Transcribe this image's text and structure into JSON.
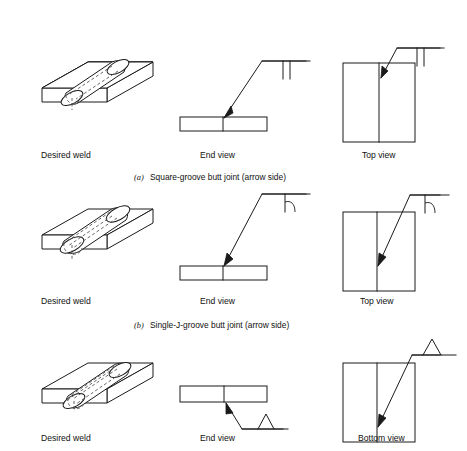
{
  "figure": {
    "background_color": "#ffffff",
    "line_color": "#1a1a1a",
    "hidden_line_color": "#555555",
    "width": 467,
    "height": 451
  },
  "rows": [
    {
      "id": "row-a",
      "caption_marker": "(a)",
      "caption_text": "Square-groove butt joint (arrow side)",
      "weld_symbol": "square-groove",
      "symbol_side": "arrow-side-below-reference-line",
      "views": [
        {
          "id": "view-a-iso",
          "label": "Desired weld"
        },
        {
          "id": "view-a-end",
          "label": "End view"
        },
        {
          "id": "view-a-top",
          "label": "Top view"
        }
      ]
    },
    {
      "id": "row-b",
      "caption_marker": "(b)",
      "caption_text": "Single-J-groove butt joint (arrow side)",
      "weld_symbol": "single-J-groove",
      "symbol_side": "arrow-side-below-reference-line",
      "views": [
        {
          "id": "view-b-iso",
          "label": "Desired weld"
        },
        {
          "id": "view-b-end",
          "label": "End view"
        },
        {
          "id": "view-b-top",
          "label": "Top view"
        }
      ]
    },
    {
      "id": "row-c",
      "caption_marker": "",
      "caption_text": "",
      "weld_symbol": "single-V-groove",
      "symbol_side": "other-side-above-reference-line",
      "views": [
        {
          "id": "view-c-iso",
          "label": "Desired weld"
        },
        {
          "id": "view-c-end",
          "label": "End view"
        },
        {
          "id": "view-c-bottom",
          "label": "Bottom view"
        }
      ]
    }
  ]
}
